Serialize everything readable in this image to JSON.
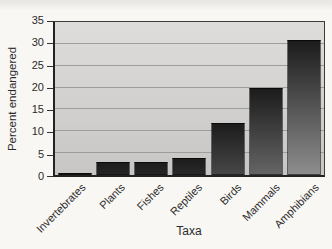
{
  "chart_data": {
    "type": "bar",
    "title": "",
    "categories": [
      "Invertebrates",
      "Plants",
      "Fishes",
      "Reptiles",
      "Birds",
      "Mammals",
      "Amphibians"
    ],
    "values": [
      0.5,
      3,
      3,
      4,
      12,
      20,
      31
    ],
    "xlabel": "Taxa",
    "ylabel": "Percent endangered",
    "ylim": [
      0,
      35
    ],
    "yticks": [
      0,
      5,
      10,
      15,
      20,
      25,
      30,
      35
    ],
    "grid": true,
    "legend": "none",
    "colors": {
      "bar_gradient_top": "#1c1c1c",
      "bar_gradient_bottom": "#9e9e9e",
      "plot_bg_top": "#dedddb",
      "plot_bg_bottom": "#c7c6c4",
      "gridline": "#9d9d9b",
      "axis": "#333333",
      "text": "#2b2b2b",
      "page_bg": "#f8f7f3"
    }
  }
}
